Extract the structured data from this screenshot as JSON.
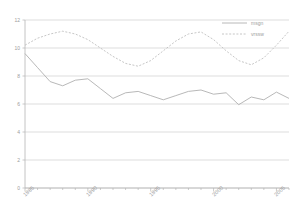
{
  "chart_data": {
    "type": "line",
    "title": "",
    "xlabel": "",
    "ylabel": "",
    "xlim": [
      1985,
      2006
    ],
    "ylim": [
      0,
      12
    ],
    "yticks": [
      0,
      2,
      4,
      6,
      8,
      10,
      12
    ],
    "ytick_labels": [
      "0",
      "2",
      "4",
      "6",
      "8",
      "10",
      "12"
    ],
    "xticks": [
      1985,
      1990,
      1995,
      2000,
      2005
    ],
    "xtick_labels": [
      "1985",
      "1990",
      "1995",
      "2000",
      "2005"
    ],
    "grid": true,
    "grid_axis": "y",
    "legend_position": "top-right",
    "x": [
      1985,
      1986,
      1987,
      1988,
      1989,
      1990,
      1991,
      1992,
      1993,
      1994,
      1995,
      1996,
      1997,
      1998,
      1999,
      2000,
      2001,
      2002,
      2003,
      2004,
      2005,
      2006
    ],
    "series": [
      {
        "name": "msgn",
        "style": "solid",
        "color": "#b0b0b0",
        "values": [
          9.6,
          8.6,
          7.6,
          7.3,
          7.7,
          7.8,
          7.1,
          6.4,
          6.8,
          6.9,
          6.6,
          6.3,
          6.6,
          6.9,
          7.0,
          6.7,
          6.8,
          5.95,
          6.5,
          6.3,
          6.85,
          6.4
        ]
      },
      {
        "name": "vrssw",
        "style": "dotted",
        "color": "#c0c0c0",
        "values": [
          10.2,
          10.7,
          11.0,
          11.2,
          11.0,
          10.6,
          10.0,
          9.4,
          8.9,
          8.7,
          9.1,
          9.8,
          10.5,
          11.0,
          11.15,
          10.6,
          9.8,
          9.1,
          8.8,
          9.3,
          10.2,
          11.2
        ]
      }
    ]
  },
  "axes": {
    "y_tick_labels": [
      "12",
      "10",
      "8",
      "6",
      "4",
      "2",
      "0"
    ],
    "x_tick_labels": [
      "1985",
      "1990",
      "1995",
      "2000",
      "2005"
    ]
  },
  "legend": {
    "entries": [
      {
        "label": "msgn",
        "style": "solid"
      },
      {
        "label": "vrssw",
        "style": "dotted"
      }
    ]
  },
  "colors": {
    "series_solid": "#b0b0b0",
    "series_dotted": "#c0c0c0",
    "grid": "#cfcfcf",
    "axis": "#b5b5b5",
    "text": "#9d9d9d",
    "background": "#ffffff"
  }
}
